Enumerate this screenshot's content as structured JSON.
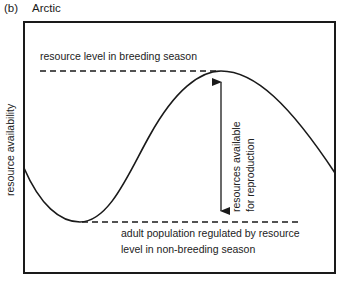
{
  "figure": {
    "panel_id": "(b)",
    "title": "Arctic",
    "ylabel": "resource availability",
    "annotations": {
      "top_dashed": "resource level in breeding season",
      "arrow_label_1": "resources available",
      "arrow_label_2": "for reproduction",
      "bottom_line1": "adult population regulated by resource",
      "bottom_line2": "level in non-breeding season"
    }
  },
  "colors": {
    "ink": "#1a1a1a",
    "background": "#ffffff"
  }
}
